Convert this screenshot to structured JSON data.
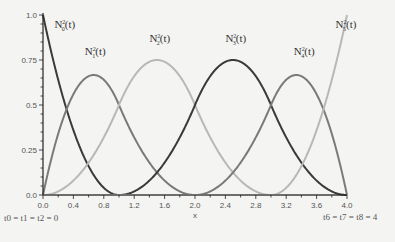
{
  "chart_data": {
    "type": "line",
    "title": "",
    "xlabel": "x",
    "ylabel": "",
    "xlim": [
      0,
      4
    ],
    "ylim": [
      0,
      1
    ],
    "grid": false,
    "legend": "inline labels",
    "x_ticks": [
      "0.0",
      "0.4",
      "0.8",
      "1.2",
      "1.6",
      "2.0",
      "2.4",
      "2.8",
      "3.2",
      "3.6",
      "4.0"
    ],
    "y_ticks": [
      "0.0",
      "0.25",
      "0.5",
      "0.75",
      "1.0"
    ],
    "knots": [
      0,
      0,
      0,
      1,
      2,
      3,
      4,
      4,
      4
    ],
    "degree": 2,
    "annotations": {
      "left_knots": "t0 = t1 = t2 = 0",
      "right_knots": "t6 = t7 = t8 = 4"
    },
    "series": [
      {
        "name": "N0^2(t)",
        "index": 0,
        "color": "#3a3a3a",
        "peak_x": 0.0,
        "peak_y": 1.0,
        "label_pos": [
          0.15,
          0.93
        ]
      },
      {
        "name": "N1^2(t)",
        "index": 1,
        "color": "#7a7a7a",
        "peak_x": 0.67,
        "peak_y": 0.667,
        "label_pos": [
          0.55,
          0.78
        ]
      },
      {
        "name": "N2^2(t)",
        "index": 2,
        "color": "#b8b8b8",
        "peak_x": 1.5,
        "peak_y": 0.75,
        "label_pos": [
          1.4,
          0.85
        ]
      },
      {
        "name": "N3^2(t)",
        "index": 3,
        "color": "#3a3a3a",
        "peak_x": 2.5,
        "peak_y": 0.75,
        "label_pos": [
          2.4,
          0.85
        ]
      },
      {
        "name": "N4^2(t)",
        "index": 4,
        "color": "#7a7a7a",
        "peak_x": 3.33,
        "peak_y": 0.667,
        "label_pos": [
          3.3,
          0.78
        ]
      },
      {
        "name": "N5^2(t)",
        "index": 5,
        "color": "#b8b8b8",
        "peak_x": 4.0,
        "peak_y": 1.0,
        "label_pos": [
          3.85,
          0.93
        ]
      }
    ]
  }
}
